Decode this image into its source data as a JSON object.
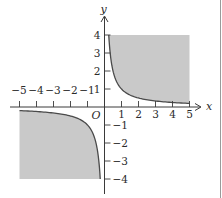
{
  "figure": {
    "type": "inequality-graph",
    "axes": {
      "x_label": "x",
      "y_label": "y",
      "origin_label": "O",
      "x_ticks": [
        "-5",
        "-4",
        "-3",
        "-2",
        "-1",
        "1",
        "2",
        "3",
        "4",
        "5"
      ],
      "y_ticks": [
        "4",
        "3",
        "2",
        "1",
        "-1",
        "-2",
        "-3",
        "-4"
      ]
    },
    "curve": {
      "equation": "y = 1/x",
      "color": "#4a4a4a"
    },
    "shaded_regions": [
      {
        "quadrant": "I",
        "x_range": [
          0.25,
          5
        ],
        "y_range": [
          0.2,
          4
        ],
        "bounded_below_by": "y = 1/x"
      },
      {
        "quadrant": "III",
        "x_range": [
          -5,
          -0.25
        ],
        "y_range": [
          -4,
          -0.2
        ],
        "bounded_above_by": "y = 1/x"
      }
    ],
    "colors": {
      "shade": "#c9c9c9",
      "axis": "#3a3a3a",
      "border": "#9a9a9a"
    }
  },
  "chart_data": {
    "type": "area",
    "title": "",
    "xlabel": "x",
    "ylabel": "y",
    "xlim": [
      -5,
      5
    ],
    "ylim": [
      -4,
      4
    ],
    "grid": false,
    "series": [
      {
        "name": "y = 1/x (x>0)",
        "x": [
          0.25,
          0.5,
          1,
          2,
          3,
          4,
          5
        ],
        "y": [
          4,
          2,
          1,
          0.5,
          0.333,
          0.25,
          0.2
        ]
      },
      {
        "name": "y = 1/x (x<0)",
        "x": [
          -5,
          -4,
          -3,
          -2,
          -1,
          -0.5,
          -0.25
        ],
        "y": [
          -0.2,
          -0.25,
          -0.333,
          -0.5,
          -1,
          -2,
          -4
        ]
      }
    ],
    "shading": "region xy >= 1 within the window (quadrants I and III)"
  }
}
